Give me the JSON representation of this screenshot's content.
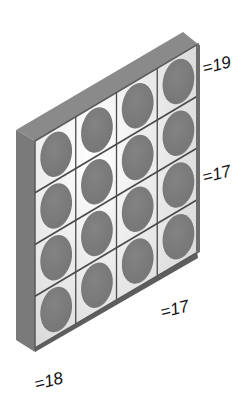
{
  "diagram": {
    "type": "isometric-grid-puzzle",
    "rows": 4,
    "cols": 4,
    "labels": {
      "top_row": "=19",
      "right_column_mid": "=17",
      "bottom_edge": "=17",
      "bottom_left_corner": "=18"
    },
    "colors": {
      "frame_top": "#8a8a8a",
      "frame_side": "#7a7a7a",
      "cell_bg": "#ececec",
      "circle": "#7d7d7d",
      "grid_line": "#4a4a4a"
    }
  }
}
